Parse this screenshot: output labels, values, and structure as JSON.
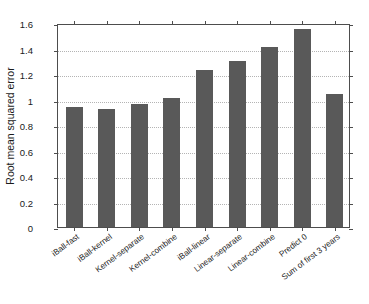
{
  "chart_data": {
    "type": "bar",
    "title": "",
    "xlabel": "",
    "ylabel": "Root mean squared error",
    "categories": [
      "iBall-fast",
      "iBall-kernel",
      "Kernel-separate",
      "Kernel-combine",
      "iBall-linear",
      "Linear-separate",
      "Linear-combine",
      "Predict 0",
      "Sum of first 3 years"
    ],
    "values": [
      0.945,
      0.925,
      0.965,
      1.01,
      1.235,
      1.3,
      1.415,
      1.55,
      1.04
    ],
    "ylim": [
      0,
      1.6
    ],
    "yticks": [
      0,
      0.2,
      0.4,
      0.6,
      0.8,
      1,
      1.2,
      1.4,
      1.6
    ],
    "ytick_labels": [
      "0",
      "0.2",
      "0.4",
      "0.6",
      "0.8",
      "1",
      "1.2",
      "1.4",
      "1.6"
    ],
    "grid": true,
    "legend": null,
    "bar_color": "#595959",
    "axis_color": "#4d4d4d",
    "grid_color": "#b4b4b4"
  }
}
